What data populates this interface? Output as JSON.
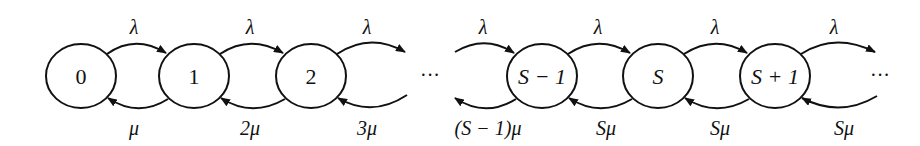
{
  "diagram": {
    "type": "birth-death state transition diagram",
    "states": [
      {
        "id": "s0",
        "label": "0"
      },
      {
        "id": "s1",
        "label": "1"
      },
      {
        "id": "s2",
        "label": "2"
      },
      {
        "id": "sSm1",
        "label": "S − 1"
      },
      {
        "id": "sS",
        "label": "S"
      },
      {
        "id": "sSp1",
        "label": "S + 1"
      }
    ],
    "ellipsis_middle": "···",
    "ellipsis_end": "···",
    "arrival_rates": [
      "λ",
      "λ",
      "λ",
      "λ",
      "λ",
      "λ",
      "λ"
    ],
    "service_rates": [
      "μ",
      "2μ",
      "3μ",
      "(S − 1)μ",
      "Sμ",
      "Sμ",
      "Sμ"
    ]
  }
}
